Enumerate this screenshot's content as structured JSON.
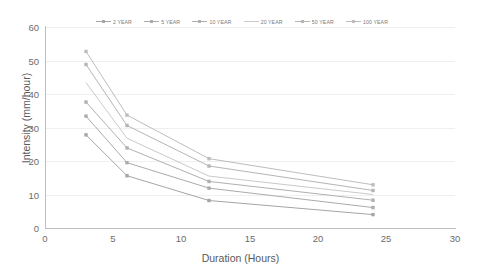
{
  "chart_data": {
    "type": "line",
    "title": "",
    "xlabel": "Duration (Hours)",
    "ylabel": "Intensity (mm/hour)",
    "x": [
      3,
      6,
      12,
      24
    ],
    "xlim": [
      0,
      30
    ],
    "ylim": [
      0,
      60
    ],
    "xticks": [
      "0",
      "5",
      "10",
      "15",
      "20",
      "25",
      "30"
    ],
    "yticks": [
      "0",
      "10",
      "20",
      "30",
      "40",
      "50",
      "60"
    ],
    "grid": true,
    "legend_position": "top",
    "series": [
      {
        "name": "2 YEAR",
        "color": "#a6a6a6",
        "values": [
          27.8,
          15.6,
          8.2,
          4.0
        ]
      },
      {
        "name": "5 YEAR",
        "color": "#ababab",
        "values": [
          33.4,
          19.5,
          11.9,
          6.1
        ]
      },
      {
        "name": "10 YEAR",
        "color": "#b0b0b0",
        "values": [
          37.6,
          23.9,
          13.9,
          8.3
        ]
      },
      {
        "name": "20 YEAR",
        "color": "#cacaca",
        "values": [
          43.4,
          26.8,
          15.5,
          10.0
        ]
      },
      {
        "name": "50 YEAR",
        "color": "#b5b5b5",
        "values": [
          48.8,
          30.6,
          18.5,
          11.2
        ]
      },
      {
        "name": "100 YEAR",
        "color": "#bdbdbd",
        "values": [
          52.7,
          33.7,
          20.7,
          12.9
        ]
      }
    ]
  },
  "legend": {
    "items": [
      {
        "label": "2 YEAR"
      },
      {
        "label": "5 YEAR"
      },
      {
        "label": "10 YEAR"
      },
      {
        "label": "20 YEAR"
      },
      {
        "label": "50 YEAR"
      },
      {
        "label": "100 YEAR"
      }
    ]
  },
  "axes": {
    "x_title": "Duration (Hours)",
    "y_title": "Intensity (mm/hour)",
    "x_ticks": [
      "0",
      "5",
      "10",
      "15",
      "20",
      "25",
      "30"
    ],
    "y_ticks": [
      "0",
      "10",
      "20",
      "30",
      "40",
      "50",
      "60"
    ]
  },
  "colors": {
    "axis": "#bfbfbf",
    "grid": "#efefef",
    "text": "#595959",
    "background": "#ffffff"
  }
}
